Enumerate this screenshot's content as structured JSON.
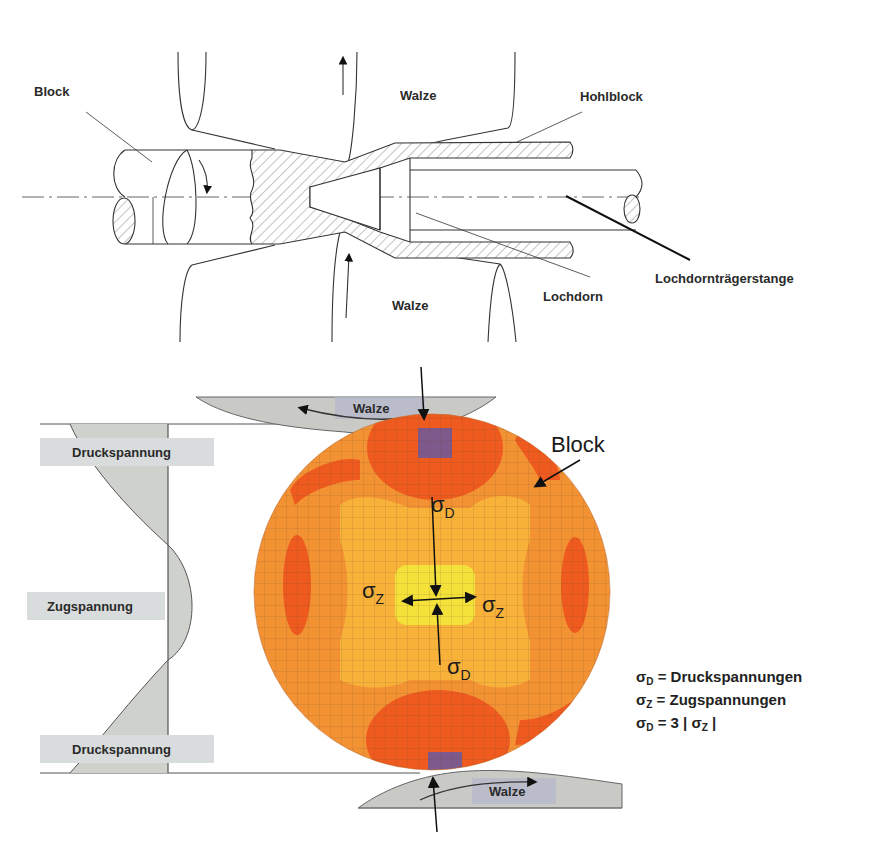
{
  "top_diagram": {
    "title": "Schrägwalzen (Lochen) – Schnittdarstellung",
    "labels": {
      "block": "Block",
      "walze_top": "Walze",
      "walze_bottom": "Walze",
      "hohlblock": "Hohlblock",
      "lochdorn": "Lochdorn",
      "lochdorntraegerstange": "Lochdornträgerstange"
    }
  },
  "bottom_diagram": {
    "labels": {
      "walze_top": "Walze",
      "walze_bottom": "Walze",
      "block": "Block",
      "druckspannung_top": "Druckspannung",
      "zugspannung": "Zugspannung",
      "druckspannung_bottom": "Druckspannung"
    },
    "stress_symbols": {
      "sigma": "σ",
      "d_sub": "D",
      "z_sub": "Z"
    },
    "colors": {
      "outer": "#f39233",
      "hot": "#ef5a1f",
      "mid": "#f8b23a",
      "core": "#f4e13a",
      "contact": "#6a5aa0",
      "roll": "#c9c9c5",
      "label_box": "#d8dcdc"
    }
  },
  "legend": {
    "line1_sym": "σ",
    "line1_sub": "D",
    "line1_text": " = Druckspannungen",
    "line2_sym": "σ",
    "line2_sub": "Z",
    "line2_text": " = Zugspannungen",
    "line3_sym": "σ",
    "line3_sub": "D",
    "line3_mid": " = 3 | σ",
    "line3_sub2": "Z",
    "line3_end": " |"
  }
}
